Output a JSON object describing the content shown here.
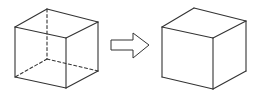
{
  "diagram": {
    "colors": {
      "stroke": "#333333",
      "background": "#ffffff"
    },
    "left_cube": {
      "label": "cube-with-hidden-edges",
      "visible_edges": [
        [
          15,
          27,
          47,
          9
        ],
        [
          47,
          9,
          98,
          22
        ],
        [
          98,
          22,
          66,
          38
        ],
        [
          66,
          38,
          15,
          27
        ],
        [
          15,
          27,
          15,
          77
        ],
        [
          66,
          38,
          66,
          88
        ],
        [
          98,
          22,
          98,
          71
        ],
        [
          15,
          77,
          66,
          88
        ],
        [
          66,
          88,
          98,
          71
        ]
      ],
      "hidden_edges": [
        [
          47,
          9,
          47,
          59
        ],
        [
          47,
          59,
          15,
          77
        ],
        [
          47,
          59,
          98,
          71
        ]
      ]
    },
    "arrow": {
      "label": "transform-arrow",
      "points": "111,40 133,40 133,33 149,45 133,58 133,50 111,50"
    },
    "right_cube": {
      "label": "solid-cube",
      "visible_edges": [
        [
          162,
          27,
          194,
          8
        ],
        [
          194,
          8,
          246,
          21
        ],
        [
          246,
          21,
          213,
          38
        ],
        [
          213,
          38,
          162,
          27
        ],
        [
          162,
          27,
          162,
          77
        ],
        [
          213,
          38,
          213,
          89
        ],
        [
          246,
          21,
          246,
          71
        ],
        [
          162,
          77,
          213,
          89
        ],
        [
          213,
          89,
          246,
          71
        ]
      ]
    }
  }
}
